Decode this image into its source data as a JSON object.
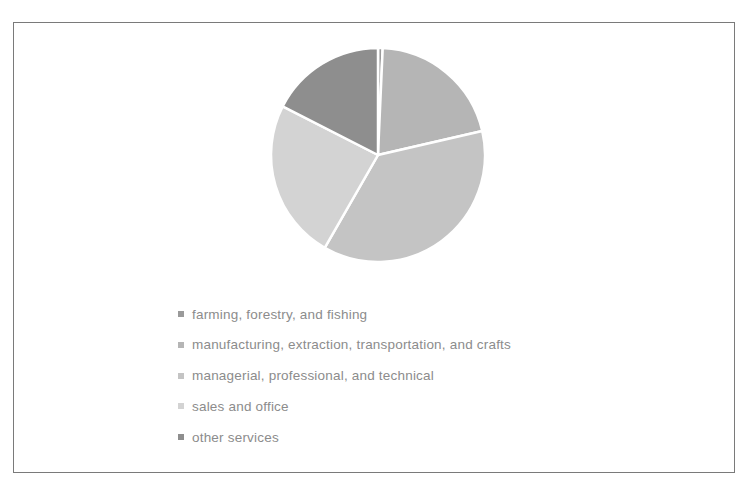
{
  "chart_data": {
    "type": "pie",
    "title": "",
    "categories": [
      "farming, forestry, and fishing",
      "manufacturing, extraction, transportation, and crafts",
      "managerial, professional, and technical",
      "sales and office",
      "other services"
    ],
    "values": [
      0.7,
      20.7,
      36.9,
      24.2,
      17.5
    ],
    "unit": "percent (estimated from slice angles)",
    "colors": [
      "#9a9a9a",
      "#b5b5b5",
      "#c4c4c4",
      "#d3d3d3",
      "#8e8e8e"
    ],
    "start_angle_deg": 0,
    "direction": "clockwise",
    "legend_position": "bottom-left"
  },
  "legend": {
    "items": [
      {
        "label": "farming, forestry, and fishing",
        "color": "#9a9a9a"
      },
      {
        "label": "manufacturing, extraction, transportation, and crafts",
        "color": "#b5b5b5"
      },
      {
        "label": "managerial, professional, and technical",
        "color": "#c4c4c4"
      },
      {
        "label": "sales and office",
        "color": "#d3d3d3"
      },
      {
        "label": "other services",
        "color": "#8e8e8e"
      }
    ]
  }
}
